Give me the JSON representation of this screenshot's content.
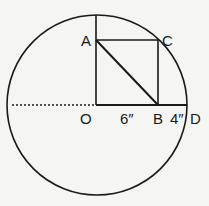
{
  "diagram": {
    "circle": {
      "cx": 97,
      "cy": 105,
      "r": 90,
      "stroke": "#1a1a1a"
    },
    "points": {
      "O": {
        "label": "O",
        "x": 96,
        "y": 105
      },
      "A": {
        "label": "A",
        "x": 96,
        "y": 40
      },
      "B": {
        "label": "B",
        "x": 158,
        "y": 105
      },
      "C": {
        "label": "C",
        "x": 158,
        "y": 40
      },
      "D": {
        "label": "D",
        "x": 187,
        "y": 105
      }
    },
    "measurements": {
      "OB": "6″",
      "BD": "4″"
    }
  }
}
